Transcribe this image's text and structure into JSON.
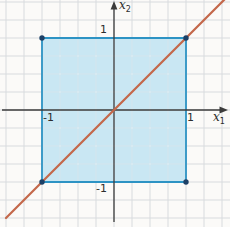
{
  "figure_name": "unit-square-with-identity-line",
  "colors": {
    "background": "#fbfaf8",
    "grid": "#d8dbde",
    "inner_grid": "rgba(255,255,255,0.5)",
    "region_fill": "rgba(132,206,235,0.42)",
    "region_stroke": "#2d93c4",
    "diagonal_line": "#c4684b",
    "axis": "#3b3b3b",
    "vertex_dot": "#1d4066",
    "label_text": "#2d2d2d"
  },
  "geometry": {
    "width": 230,
    "height": 227,
    "origin_px": {
      "x": 114,
      "y": 110
    },
    "unit_px": 72,
    "grid_spacing_px": 18,
    "grid_offset_px": {
      "x": 6,
      "y": 2
    }
  },
  "axes": {
    "x_label_base": "x",
    "x_label_sub": "1",
    "y_label_base": "x",
    "y_label_sub": "2"
  },
  "ticks": {
    "x_pos": "1",
    "x_neg": "-1",
    "y_pos": "1",
    "y_neg": "-1"
  },
  "shapes": {
    "square_region": {
      "vertices_units": [
        [
          -1,
          1
        ],
        [
          1,
          1
        ],
        [
          1,
          -1
        ],
        [
          -1,
          -1
        ]
      ],
      "corner_dots_units": [
        [
          -1,
          1
        ],
        [
          1,
          1
        ],
        [
          1,
          -1
        ],
        [
          -1,
          -1
        ]
      ],
      "dot_radius_px": 2.7
    },
    "diagonal_line": {
      "through_units": [
        [
          -1,
          -1
        ],
        [
          1,
          1
        ]
      ],
      "extend_before": 0.25,
      "extend_after": 0.3
    }
  }
}
